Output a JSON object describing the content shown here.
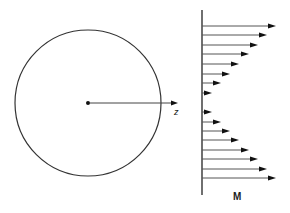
{
  "figure": {
    "circle": {
      "cx": 88,
      "cy": 103,
      "r": 73
    },
    "center_dot": {
      "cx": 88,
      "cy": 103
    },
    "radius_arrow": {
      "x1": 90,
      "y1": 103,
      "x2": 178,
      "y2": 103
    },
    "radius_label": "z",
    "axis": {
      "x": 202,
      "y1": 10,
      "y2": 195
    },
    "moment_label": "M",
    "arrows": [
      {
        "y": 26,
        "tip": 276
      },
      {
        "y": 35,
        "tip": 267
      },
      {
        "y": 45,
        "tip": 258
      },
      {
        "y": 54,
        "tip": 249
      },
      {
        "y": 64,
        "tip": 239
      },
      {
        "y": 74,
        "tip": 230
      },
      {
        "y": 83,
        "tip": 221
      },
      {
        "y": 93,
        "tip": 212
      },
      {
        "y": 112,
        "tip": 212
      },
      {
        "y": 122,
        "tip": 221
      },
      {
        "y": 131,
        "tip": 230
      },
      {
        "y": 140,
        "tip": 239
      },
      {
        "y": 150,
        "tip": 249
      },
      {
        "y": 159,
        "tip": 258
      },
      {
        "y": 169,
        "tip": 267
      },
      {
        "y": 178,
        "tip": 276
      }
    ],
    "stroke_color": "#333333",
    "arrow_color": "#555555"
  }
}
